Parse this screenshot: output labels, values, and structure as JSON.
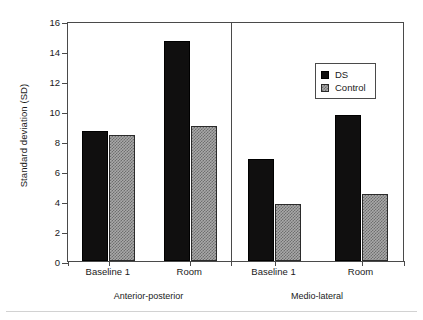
{
  "axes": {
    "ylabel": "Standard deviation (SD)",
    "yticks": [
      "0",
      "2",
      "4",
      "6",
      "8",
      "10",
      "12",
      "14",
      "16"
    ]
  },
  "legend": {
    "items": [
      {
        "label": "DS",
        "swatch": "solid-black"
      },
      {
        "label": "Control",
        "swatch": "stippled-gray"
      }
    ]
  },
  "panels": [
    {
      "label": "Anterior-posterior",
      "categories": [
        "Baseline 1",
        "Room"
      ]
    },
    {
      "label": "Medio-lateral",
      "categories": [
        "Baseline 1",
        "Room"
      ]
    }
  ],
  "chart_data": {
    "type": "bar",
    "title": "",
    "xlabel": "",
    "ylabel": "Standard deviation (SD)",
    "ylim": [
      0,
      16
    ],
    "ytick_step": 2,
    "grid": false,
    "legend_position": "top-right-inside",
    "panels": [
      {
        "name": "Anterior-posterior",
        "categories": [
          "Baseline 1",
          "Room"
        ],
        "series": [
          {
            "name": "DS",
            "values": [
              8.65,
              14.65
            ]
          },
          {
            "name": "Control",
            "values": [
              8.4,
              9.0
            ]
          }
        ]
      },
      {
        "name": "Medio-lateral",
        "categories": [
          "Baseline 1",
          "Room"
        ],
        "series": [
          {
            "name": "DS",
            "values": [
              6.8,
              9.75
            ]
          },
          {
            "name": "Control",
            "values": [
              3.8,
              4.5
            ]
          }
        ]
      }
    ]
  }
}
